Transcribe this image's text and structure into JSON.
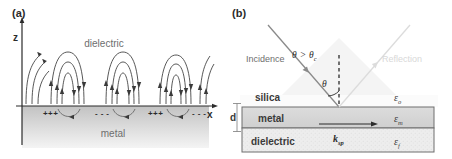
{
  "figure": {
    "panels": [
      {
        "id": "a",
        "label": "(a)",
        "axes": {
          "z_label": "z",
          "x_label": "x"
        },
        "regions": [
          {
            "name": "dielectric",
            "label": "dielectric"
          },
          {
            "name": "metal",
            "label": "metal"
          }
        ],
        "surface_charges": [
          "+++",
          "- - -",
          "+++",
          "- - -"
        ],
        "colors": {
          "field_line": "#3a3a3a",
          "axis": "#2b2b2b",
          "metal_fill": "#d0d0d0",
          "label_text": "#6e6e6e"
        }
      },
      {
        "id": "b",
        "label": "(b)",
        "beams": [
          {
            "name": "incidence",
            "label": "Incidence",
            "faded": false
          },
          {
            "name": "reflection",
            "label": "Reflection",
            "faded": true
          }
        ],
        "angle_annotations": [
          {
            "name": "critical-angle-condition",
            "symbol": "θ",
            "relation": ">",
            "sub_symbol": "θ",
            "sub_text": "c"
          },
          {
            "name": "incidence-angle",
            "symbol": "θ"
          }
        ],
        "thickness_label": "d",
        "wavevector": {
          "symbol": "k",
          "subscript": "sp"
        },
        "layers": [
          {
            "name": "silica",
            "label": "silica",
            "permittivity_symbol": "ε",
            "permittivity_sub": "o"
          },
          {
            "name": "metal",
            "label": "metal",
            "permittivity_symbol": "ε",
            "permittivity_sub": "m"
          },
          {
            "name": "dielectric",
            "label": "dielectric",
            "permittivity_symbol": "ε",
            "permittivity_sub": "f"
          }
        ],
        "colors": {
          "beam": "#8a8a8a",
          "beam_faded": "#dcdcdc",
          "prism_fill": "#f2f2f2",
          "metal_fill": "#dadada",
          "dielectric_fill": "#ececec",
          "border": "#6e6e6e"
        }
      }
    ]
  }
}
